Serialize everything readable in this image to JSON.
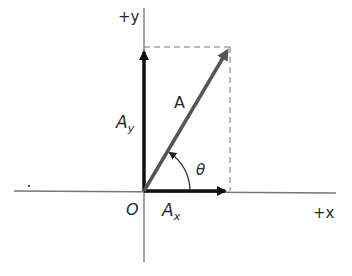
{
  "diagram": {
    "axes": {
      "x_label": "+x",
      "y_label": "+y",
      "origin_label": "O"
    },
    "vector": {
      "label": "A",
      "components": {
        "x": {
          "base": "A",
          "sub": "x"
        },
        "y": {
          "base": "A",
          "sub": "y"
        }
      },
      "angle_label": "θ"
    },
    "colors": {
      "axis": "#555555",
      "vector": "#555555",
      "component": "#111111",
      "dashed": "#666666"
    }
  }
}
